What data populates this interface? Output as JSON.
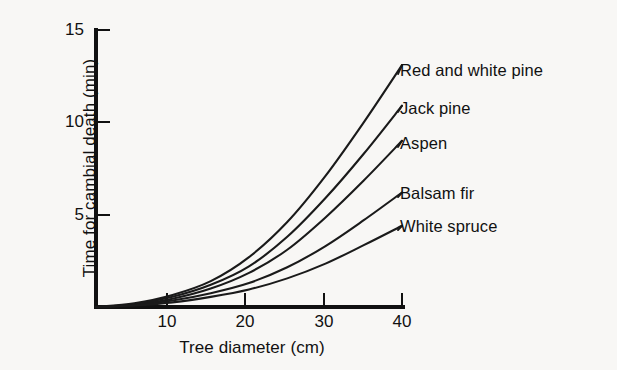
{
  "chart_data": {
    "type": "line",
    "title": "",
    "subtitle": "",
    "xlabel": "Tree diameter (cm)",
    "ylabel": "Time for cambial death (min)",
    "xlim": [
      0,
      40
    ],
    "ylim": [
      0,
      15
    ],
    "xticks": [
      10,
      20,
      30,
      40
    ],
    "xtick_labels": [
      "10",
      "20",
      "30",
      "40"
    ],
    "yticks": [
      5,
      10,
      15
    ],
    "ytick_labels": [
      "5",
      "10",
      "15"
    ],
    "grid": false,
    "legend_position": "inline-right-of-curve-ends",
    "line_color": "#1a1a1a",
    "background_color": "#f8f7f5",
    "x": [
      0,
      5,
      10,
      15,
      20,
      25,
      30,
      35,
      40
    ],
    "series": [
      {
        "name": "Red and white pine",
        "label": "Red and white pine",
        "values": [
          0,
          0.2,
          0.65,
          1.4,
          2.7,
          4.6,
          7.1,
          10.0,
          13.1
        ],
        "end_value": 13.1
      },
      {
        "name": "Jack pine",
        "label": "Jack pine",
        "values": [
          0,
          0.15,
          0.55,
          1.2,
          2.2,
          3.8,
          5.9,
          8.3,
          10.9
        ],
        "end_value": 10.9
      },
      {
        "name": "Aspen",
        "label": "Aspen",
        "values": [
          0,
          0.12,
          0.45,
          1.0,
          1.85,
          3.1,
          4.85,
          6.85,
          9.0
        ],
        "end_value": 9.0
      },
      {
        "name": "Balsam fir",
        "label": "Balsam fir",
        "values": [
          0,
          0.1,
          0.35,
          0.75,
          1.3,
          2.15,
          3.3,
          4.7,
          6.2
        ],
        "end_value": 6.2
      },
      {
        "name": "White spruce",
        "label": "White spruce",
        "values": [
          0,
          0.08,
          0.25,
          0.55,
          0.95,
          1.55,
          2.35,
          3.35,
          4.4
        ],
        "end_value": 4.4
      }
    ]
  },
  "axes": {
    "y_title": "Time for cambial death (min)",
    "x_title": "Tree diameter (cm)",
    "y_tick_labels": [
      "15",
      "10",
      "5"
    ],
    "x_tick_labels": [
      "10",
      "20",
      "30",
      "40"
    ]
  },
  "series_labels": [
    "Red and white pine",
    "Jack pine",
    "Aspen",
    "Balsam fir",
    "White spruce"
  ]
}
